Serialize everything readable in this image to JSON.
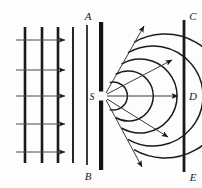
{
  "figure": {
    "type": "physics-diagram",
    "background_color": "#fdfdfd",
    "stroke_color": "#1a1a1a"
  },
  "labels": {
    "barrier_top": "A",
    "barrier_bottom": "B",
    "slit": "S",
    "screen_top": "C",
    "screen_middle": "D",
    "screen_bottom": "E"
  },
  "plane_waves": {
    "description": "incident plane wavefronts travelling to the right",
    "count": 5,
    "x_positions": [
      25,
      42,
      58,
      73,
      87
    ],
    "line_widths": [
      2.6,
      2.6,
      2.6,
      1.8,
      1.6
    ],
    "y_top": 27,
    "y_bottom": 163
  },
  "incident_rays": {
    "description": "horizontal arrows showing direction of propagation",
    "count": 5,
    "y_positions": [
      40,
      70,
      96,
      124,
      152
    ],
    "x_start": 16,
    "x_end": 66
  },
  "barrier": {
    "name": "opaque-barrier-AB",
    "x": 99,
    "y_top": 22,
    "y_bottom": 170,
    "width": 4,
    "slit": {
      "center_y": 96,
      "gap": 9
    }
  },
  "circular_wavefronts": {
    "description": "secondary circular wavelets spreading from slit S",
    "count": 5,
    "center_x": 103,
    "center_y": 96,
    "radii": [
      14,
      25,
      37,
      50,
      62
    ],
    "angle_span_deg": 150
  },
  "radial_rays": {
    "description": "arrows showing diffracted wave directions from S",
    "count": 5,
    "angles_deg": [
      -55,
      -28,
      0,
      30,
      58
    ],
    "lengths": [
      72,
      78,
      80,
      76,
      72
    ]
  },
  "screen": {
    "name": "screen-CE",
    "x": 183,
    "y_top": 20,
    "y_bottom": 172,
    "width": 2.6
  }
}
